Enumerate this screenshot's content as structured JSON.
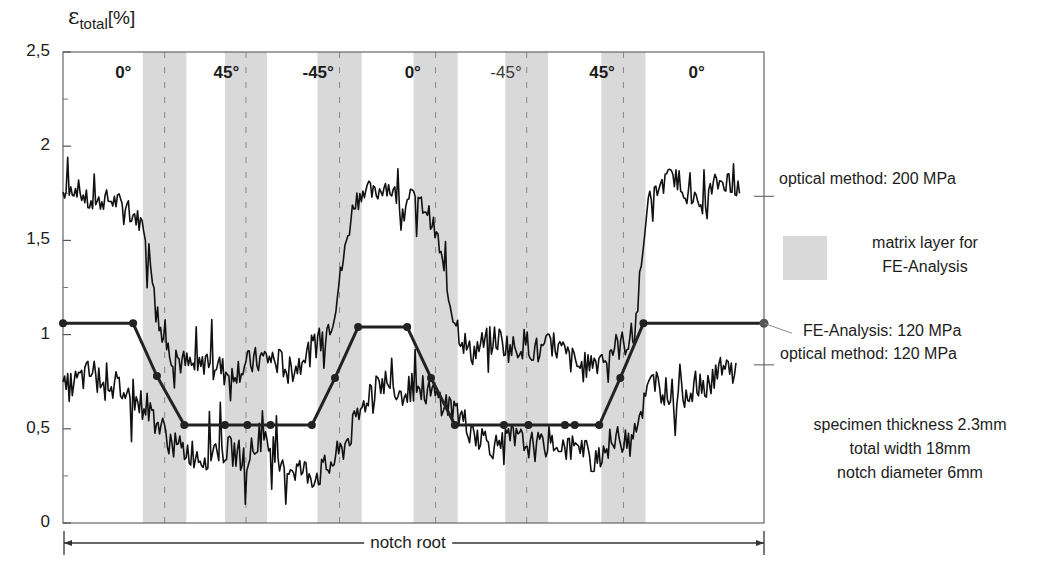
{
  "chart_data": {
    "type": "line",
    "title": "",
    "ylabel": "ε total [%]",
    "ylabel_parts": {
      "symbol": "ε",
      "subscript": "total",
      "unit": "[%]"
    },
    "xlabel": "notch root",
    "ylim": [
      0,
      2.5
    ],
    "yticks": [
      {
        "value": 0,
        "label": "0"
      },
      {
        "value": 0.5,
        "label": "0,5"
      },
      {
        "value": 1,
        "label": "1"
      },
      {
        "value": 1.5,
        "label": "1,5"
      },
      {
        "value": 2,
        "label": "2"
      },
      {
        "value": 2.5,
        "label": "2,5"
      }
    ],
    "xlim": [
      0,
      100
    ],
    "grid": false,
    "ply_orientations": [
      {
        "label": "0°",
        "x_center": 8.6,
        "bold": true
      },
      {
        "label": "45°",
        "x_center": 23.3,
        "bold": true
      },
      {
        "label": "-45°",
        "x_center": 36.4,
        "bold": true
      },
      {
        "label": "0°",
        "x_center": 49.9,
        "bold": true
      },
      {
        "label": "-45°",
        "x_center": 63.2,
        "bold": false
      },
      {
        "label": "45°",
        "x_center": 76.9,
        "bold": true
      },
      {
        "label": "0°",
        "x_center": 90.4,
        "bold": true
      }
    ],
    "matrix_layer_bands": [
      {
        "x_start": 11.4,
        "x_end": 17.6
      },
      {
        "x_start": 23.1,
        "x_end": 29.1
      },
      {
        "x_start": 36.3,
        "x_end": 42.6
      },
      {
        "x_start": 50.0,
        "x_end": 56.3
      },
      {
        "x_start": 63.1,
        "x_end": 69.2
      },
      {
        "x_start": 76.8,
        "x_end": 83.1
      }
    ],
    "series": [
      {
        "name": "optical method: 200 MPa",
        "style": "noisy-line",
        "x": [
          0,
          2,
          4,
          6,
          8,
          10,
          11.5,
          12.5,
          13.5,
          15,
          17,
          19,
          21,
          23,
          25,
          27,
          29,
          31,
          33,
          35,
          37,
          38.5,
          40,
          41.5,
          43,
          44.5,
          46,
          48,
          50,
          52,
          53.5,
          55,
          56.5,
          58,
          60,
          62,
          64,
          66,
          68,
          70,
          72,
          74,
          76,
          78,
          80,
          81.5,
          82.5,
          83.5,
          85,
          87,
          89,
          91,
          93,
          95,
          96.5
        ],
        "y": [
          1.75,
          1.78,
          1.68,
          1.72,
          1.7,
          1.64,
          1.58,
          1.4,
          1.1,
          0.92,
          0.85,
          0.82,
          0.88,
          0.8,
          0.82,
          0.85,
          0.88,
          0.85,
          0.82,
          0.9,
          0.98,
          1.1,
          1.4,
          1.7,
          1.78,
          1.74,
          1.8,
          1.72,
          1.72,
          1.66,
          1.5,
          1.2,
          1.02,
          0.9,
          0.95,
          0.98,
          0.92,
          0.96,
          0.9,
          0.95,
          0.88,
          0.82,
          0.86,
          0.92,
          0.95,
          1.0,
          1.35,
          1.7,
          1.78,
          1.85,
          1.75,
          1.68,
          1.8,
          1.82,
          1.75
        ]
      },
      {
        "name": "optical method: 120 MPa",
        "style": "noisy-line",
        "x": [
          0,
          2,
          4,
          6,
          8,
          10,
          12,
          14,
          16,
          18,
          20,
          22,
          24,
          26,
          28,
          30,
          32,
          34,
          36,
          38,
          40,
          42,
          44,
          46,
          48,
          50,
          52,
          54,
          56,
          58,
          60,
          62,
          64,
          66,
          68,
          70,
          72,
          74,
          76,
          78,
          80,
          82,
          84,
          86,
          88,
          90,
          92,
          94,
          96
        ],
        "y": [
          0.7,
          0.75,
          0.8,
          0.78,
          0.72,
          0.65,
          0.62,
          0.5,
          0.4,
          0.38,
          0.35,
          0.4,
          0.38,
          0.35,
          0.42,
          0.4,
          0.3,
          0.28,
          0.25,
          0.3,
          0.4,
          0.55,
          0.72,
          0.75,
          0.7,
          0.72,
          0.7,
          0.65,
          0.6,
          0.5,
          0.45,
          0.4,
          0.45,
          0.42,
          0.4,
          0.45,
          0.4,
          0.38,
          0.35,
          0.42,
          0.45,
          0.55,
          0.75,
          0.7,
          0.68,
          0.72,
          0.75,
          0.8,
          0.85
        ]
      },
      {
        "name": "FE-Analysis: 120 MPa",
        "style": "line-with-markers",
        "x": [
          0,
          10.0,
          13.4,
          17.3,
          23.1,
          26.3,
          29.6,
          35.5,
          38.8,
          42.1,
          49.1,
          52.5,
          55.9,
          62.9,
          66.4,
          71.6,
          73.0,
          76.5,
          79.5,
          82.8,
          100
        ],
        "y": [
          1.06,
          1.06,
          0.78,
          0.52,
          0.52,
          0.52,
          0.52,
          0.52,
          0.77,
          1.04,
          1.04,
          0.77,
          0.52,
          0.52,
          0.52,
          0.52,
          0.52,
          0.52,
          0.77,
          1.06,
          1.06
        ]
      }
    ],
    "legend": [
      {
        "label": "optical method: 200 MPa",
        "y_ref": 1.75
      },
      {
        "label_lines": [
          "matrix layer for",
          "FE-Analysis"
        ],
        "swatch_color": "#d9d9d9"
      },
      {
        "label": "FE-Analysis: 120 MPa",
        "y_ref": 1.06
      },
      {
        "label": "optical method: 120 MPa",
        "y_ref": 0.85
      }
    ],
    "annotations": [
      {
        "lines": [
          "specimen thickness 2.3mm",
          "total width 18mm",
          "notch diameter  6mm"
        ]
      }
    ]
  },
  "labels": {
    "ylabel_symbol": "ε",
    "ylabel_sub": "total",
    "ylabel_unit": "[%]",
    "notch_root": "notch root",
    "legend_200": "optical method: 200 MPa",
    "legend_matrix_1": "matrix layer for",
    "legend_matrix_2": "FE-Analysis",
    "legend_fe": "FE-Analysis: 120 MPa",
    "legend_120": "optical method: 120 MPa",
    "spec_1": "specimen thickness 2.3mm",
    "spec_2": "total width 18mm",
    "spec_3": "notch diameter  6mm"
  },
  "colors": {
    "band": "#d9d9d9",
    "line": "#111111",
    "frame": "#555555"
  }
}
